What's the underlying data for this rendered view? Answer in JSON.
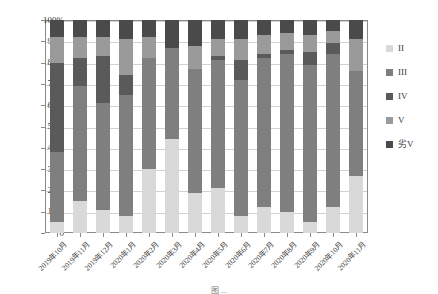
{
  "chart_data": {
    "type": "bar",
    "stacked": true,
    "normalized_percent": true,
    "title": "",
    "xlabel": "",
    "ylabel": "",
    "ylim": [
      0,
      100
    ],
    "ytick_labels": [
      "100%",
      "90%",
      "80%",
      "70%",
      "60%",
      "50%",
      "40%",
      "30%",
      "20%",
      "10%",
      "0"
    ],
    "ytick_values": [
      100,
      90,
      80,
      70,
      60,
      50,
      40,
      30,
      20,
      10,
      0
    ],
    "grid": true,
    "legend_position": "right",
    "categories": [
      "2019年10月",
      "2019年11月",
      "2019年12月",
      "2020年1月",
      "2020年2月",
      "2020年3月",
      "2020年4月",
      "2020年5月",
      "2020年6月",
      "2020年7月",
      "2020年8月",
      "2020年9月",
      "2020年10月",
      "2020年11月"
    ],
    "series": [
      {
        "name": "II",
        "values": [
          5,
          15,
          11,
          8,
          30,
          44,
          19,
          21,
          8,
          12,
          10,
          5,
          12,
          27
        ]
      },
      {
        "name": "III",
        "values": [
          33,
          54,
          50,
          57,
          52,
          43,
          58,
          60,
          64,
          70,
          74,
          74,
          72,
          49
        ]
      },
      {
        "name": "IV",
        "values": [
          42,
          13,
          22,
          9,
          0,
          0,
          0,
          2,
          9,
          2,
          2,
          6,
          5,
          0
        ]
      },
      {
        "name": "V",
        "values": [
          12,
          10,
          9,
          17,
          10,
          0,
          11,
          8,
          10,
          9,
          8,
          8,
          6,
          15
        ]
      },
      {
        "name": "劣V",
        "values": [
          8,
          8,
          8,
          9,
          8,
          13,
          12,
          9,
          9,
          7,
          6,
          7,
          5,
          9
        ]
      }
    ]
  },
  "legend": {
    "items": [
      {
        "label": "II",
        "color": "#d9d9d9"
      },
      {
        "label": "III",
        "color": "#7f7f7f"
      },
      {
        "label": "IV",
        "color": "#5a5a5a"
      },
      {
        "label": "V",
        "color": "#9a9a9a"
      },
      {
        "label": "劣V",
        "color": "#4a4a4a"
      }
    ]
  },
  "caption": {
    "text": "图 ..."
  }
}
